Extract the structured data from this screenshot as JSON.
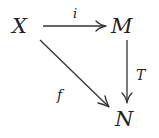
{
  "diagram": {
    "type": "commutative-diagram",
    "nodes": {
      "X": {
        "label": "X"
      },
      "M": {
        "label": "M"
      },
      "N": {
        "label": "N"
      }
    },
    "edges": {
      "i": {
        "from": "X",
        "to": "M",
        "label": "i"
      },
      "T": {
        "from": "M",
        "to": "N",
        "label": "T"
      },
      "f": {
        "from": "X",
        "to": "N",
        "label": "f"
      }
    }
  }
}
